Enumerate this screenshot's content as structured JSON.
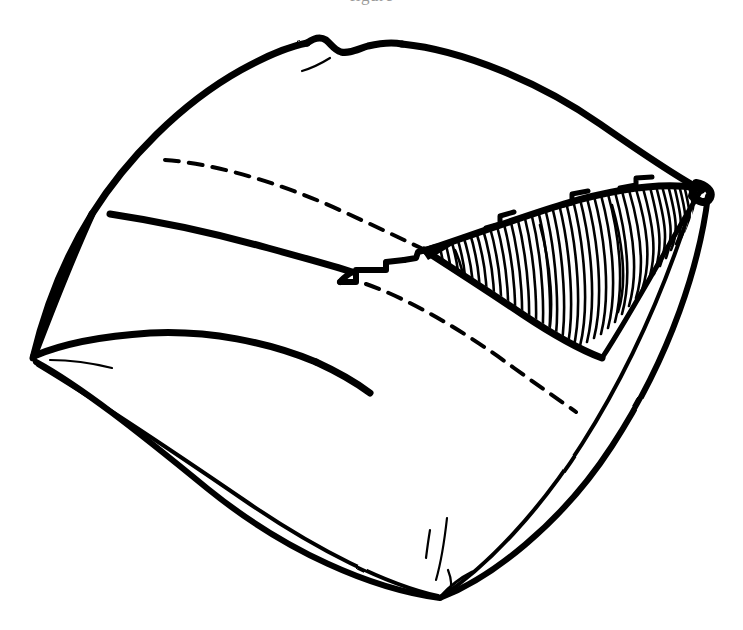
{
  "figure": {
    "kind": "line-drawing",
    "title": "",
    "caption_remnant": "figure",
    "background_color": "#ffffff",
    "ink_color": "#000000",
    "canvas": {
      "width": 743,
      "height": 630
    },
    "vertices": {
      "left": {
        "x": 33,
        "y": 358,
        "label": "left-vertex"
      },
      "bottom": {
        "x": 440,
        "y": 598,
        "label": "bottom-vertex"
      },
      "right_tip": {
        "x": 707,
        "y": 192,
        "label": "right-tip-vertex"
      },
      "top_bump": {
        "x": 330,
        "y": 44,
        "label": "top-bump"
      }
    },
    "parts": [
      {
        "name": "outer-silhouette",
        "style": "solid",
        "stroke_width": 7
      },
      {
        "name": "upper-seam-band",
        "style": "solid",
        "stroke_width": 7
      },
      {
        "name": "upper-hidden-edge",
        "style": "dashed",
        "stroke_width": 4
      },
      {
        "name": "lower-hidden-edge",
        "style": "dashed",
        "stroke_width": 4
      },
      {
        "name": "hatched-wedge",
        "style": "hatched",
        "stroke_width": 2
      },
      {
        "name": "stepped-seam-notches",
        "style": "solid",
        "stroke_width": 6
      },
      {
        "name": "bottom-right-band",
        "style": "solid",
        "stroke_width": 4
      },
      {
        "name": "bottom-left-band",
        "style": "solid",
        "stroke_width": 4
      },
      {
        "name": "left-whisker-crease",
        "style": "solid",
        "stroke_width": 2
      },
      {
        "name": "bottom-crease-ticks",
        "style": "solid",
        "stroke_width": 2
      }
    ],
    "hatching": {
      "line_count": 46,
      "orientation": "near-vertical",
      "spacing_px": 6,
      "color": "#000000"
    },
    "dashes": {
      "upper": {
        "pattern": "14 10",
        "from_x": 165,
        "from_y": 160,
        "to_x": 420,
        "to_y": 248
      },
      "lower": {
        "pattern": "14 10",
        "from_x": 366,
        "from_y": 284,
        "to_x": 576,
        "to_y": 412
      }
    }
  }
}
